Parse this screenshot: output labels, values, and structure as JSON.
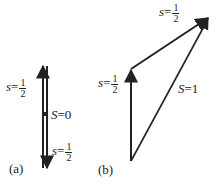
{
  "panel_a": {
    "caption": "(a)",
    "label_up": {
      "var": "s",
      "eq": "=",
      "num": "1",
      "den": "2"
    },
    "label_total": {
      "var": "S",
      "eq": "=",
      "val": "0"
    },
    "label_down": {
      "var": "s",
      "eq": "=",
      "num": "1",
      "den": "2"
    }
  },
  "panel_b": {
    "caption": "(b)",
    "label_first": {
      "var": "s",
      "eq": "=",
      "num": "1",
      "den": "2"
    },
    "label_second": {
      "var": "s",
      "eq": "=",
      "num": "1",
      "den": "2"
    },
    "label_total": {
      "var": "S",
      "eq": "=",
      "val": "1"
    }
  },
  "colors": {
    "line": "#222222"
  }
}
